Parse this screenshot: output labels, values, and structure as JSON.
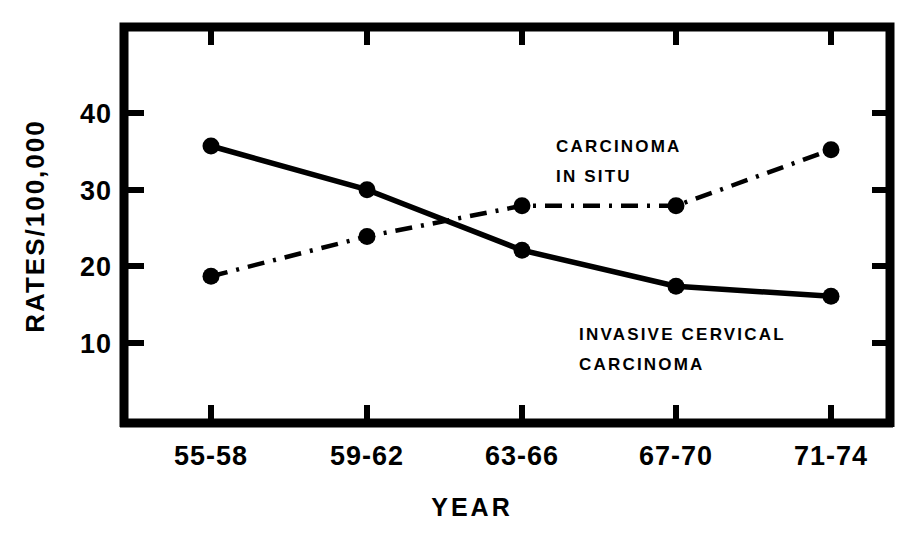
{
  "chart_data": {
    "type": "line",
    "title": "",
    "xlabel": "YEAR",
    "ylabel": "RATES/100,000",
    "categories": [
      "55-58",
      "59-62",
      "63-66",
      "67-70",
      "71-74"
    ],
    "ylim": [
      0,
      47
    ],
    "yticks": [
      10,
      20,
      30,
      40
    ],
    "ytick_labels": [
      "10",
      "20",
      "30",
      "40"
    ],
    "grid": false,
    "legend": "inline annotations",
    "series": [
      {
        "name": "INVASIVE CERVICAL CARCINOMA",
        "style": "solid",
        "marker": "filled-circle",
        "values": [
          35.7,
          30.0,
          22.1,
          17.4,
          16.1
        ]
      },
      {
        "name": "CARCINOMA IN SITU",
        "style": "dash-dot",
        "marker": "filled-circle",
        "values": [
          18.7,
          23.9,
          27.9,
          27.9,
          35.2
        ]
      }
    ],
    "annotations": [
      {
        "id": "carcinoma-in-situ",
        "line1": "CARCINOMA",
        "line2": "IN SITU",
        "x": 600,
        "y": 145
      },
      {
        "id": "invasive-cervical-carcinoma",
        "line1": "INVASIVE CERVICAL",
        "line2": "CARCINOMA",
        "x": 580,
        "y": 343
      }
    ],
    "colors": {
      "ink": "#000000",
      "background": "#ffffff"
    }
  },
  "axes": {
    "y_tick_labels": [
      "40",
      "30",
      "20",
      "10"
    ],
    "x_tick_labels": [
      "55-58",
      "59-62",
      "63-66",
      "67-70",
      "71-74"
    ],
    "y_axis_title": "RATES/100,000",
    "x_axis_title": "YEAR"
  },
  "annotations": {
    "in_situ_line1": "CARCINOMA",
    "in_situ_line2": "IN SITU",
    "invasive_line1": "INVASIVE CERVICAL",
    "invasive_line2": "CARCINOMA"
  }
}
